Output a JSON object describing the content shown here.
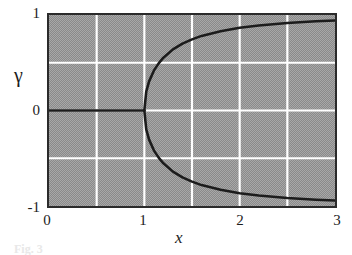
{
  "figure": {
    "caption": "Fig. 3"
  },
  "chart_data": {
    "type": "line",
    "title": "",
    "xlabel": "x",
    "ylabel": "γ",
    "xlim": [
      0,
      3
    ],
    "ylim": [
      -1,
      1
    ],
    "xticks": [
      0,
      1,
      2,
      3
    ],
    "xtick_labels": [
      "0",
      "1",
      "2",
      "3"
    ],
    "yticks": [
      -1,
      0,
      1
    ],
    "ytick_labels": [
      "-1",
      "0",
      "1"
    ],
    "grid": true,
    "grid_color": "#ffffff",
    "grid_x": [
      0.5,
      1.0,
      1.5,
      2.0,
      2.5
    ],
    "grid_y": [
      -0.5,
      0.0,
      0.5
    ],
    "plot_background": "#9a9a9a",
    "line_color": "#1c1c1c",
    "legend": "none",
    "series": [
      {
        "name": "trivial branch",
        "x": [
          0.0,
          0.2,
          0.4,
          0.6,
          0.8,
          1.0
        ],
        "values": [
          0.0,
          0.0,
          0.0,
          0.0,
          0.0,
          0.0
        ]
      },
      {
        "name": "upper branch",
        "x": [
          1.0,
          1.02,
          1.05,
          1.1,
          1.15,
          1.2,
          1.3,
          1.4,
          1.5,
          1.6,
          1.8,
          2.0,
          2.2,
          2.5,
          2.8,
          3.0
        ],
        "values": [
          0.0,
          0.197,
          0.305,
          0.417,
          0.494,
          0.553,
          0.64,
          0.7,
          0.745,
          0.781,
          0.831,
          0.866,
          0.891,
          0.917,
          0.935,
          0.943
        ]
      },
      {
        "name": "lower branch",
        "x": [
          1.0,
          1.02,
          1.05,
          1.1,
          1.15,
          1.2,
          1.3,
          1.4,
          1.5,
          1.6,
          1.8,
          2.0,
          2.2,
          2.5,
          2.8,
          3.0
        ],
        "values": [
          0.0,
          -0.197,
          -0.305,
          -0.417,
          -0.494,
          -0.553,
          -0.64,
          -0.7,
          -0.745,
          -0.781,
          -0.831,
          -0.866,
          -0.891,
          -0.917,
          -0.935,
          -0.943
        ]
      }
    ],
    "annotations": {
      "bifurcation_point_x": 1.0,
      "asymptote_upper": 1.0,
      "asymptote_lower": -1.0
    }
  }
}
